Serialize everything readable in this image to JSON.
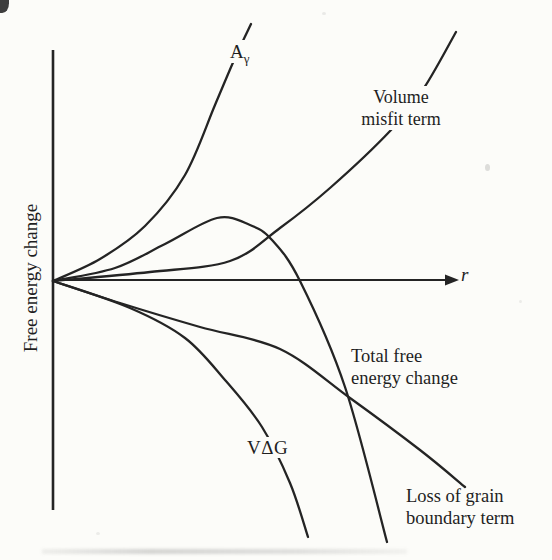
{
  "figure": {
    "background": "#fcfcf9",
    "ink": "#242424",
    "x_axis_label": "r",
    "y_axis_label": "Free energy change"
  },
  "labels": {
    "a_gamma": {
      "main": "A",
      "sub": "γ"
    },
    "volume_misfit": "Volume\nmisfit term",
    "total": "Total free\nenergy change",
    "v_delta_g": "VΔG",
    "grain_boundary": "Loss of grain\nboundary term",
    "x_axis": "r",
    "y_axis": "Free energy change"
  },
  "chart_data": {
    "type": "line",
    "title": "",
    "xlabel": "r",
    "ylabel": "Free energy change",
    "axes_style": "schematic (no numeric ticks); x-axis arrow to the right; origin on the y-axis",
    "units": "arbitrary (schematic nucleation free-energy diagram)",
    "xlim": [
      0,
      10.5
    ],
    "ylim": [
      -11.5,
      11.5
    ],
    "grid": false,
    "legend": "inline curve labels",
    "series": [
      {
        "id": "surface_area_term",
        "name": "Aγ",
        "shape": "positive, steeply increasing (interfacial area term)",
        "xy": [
          [
            0,
            0
          ],
          [
            1.2,
            0.9
          ],
          [
            2.3,
            2.3
          ],
          [
            3.3,
            4.6
          ],
          [
            4.05,
            7.6
          ],
          [
            4.55,
            9.7
          ],
          [
            4.95,
            11.1
          ]
        ],
        "px": [
          [
            53,
            281
          ],
          [
            100,
            259
          ],
          [
            145,
            226
          ],
          [
            185,
            175
          ],
          [
            215,
            105
          ],
          [
            235,
            58
          ],
          [
            251,
            24
          ]
        ]
      },
      {
        "id": "volume_misfit_term",
        "name": "Volume misfit term",
        "shape": "positive, slowly then steeply increasing",
        "xy": [
          [
            0,
            0
          ],
          [
            2.4,
            0.35
          ],
          [
            4.4,
            0.8
          ],
          [
            5.7,
            2.3
          ],
          [
            6.9,
            4.0
          ],
          [
            8.45,
            6.5
          ],
          [
            9.3,
            8.35
          ],
          [
            10.1,
            10.8
          ]
        ],
        "px": [
          [
            53,
            281
          ],
          [
            150,
            272
          ],
          [
            230,
            261
          ],
          [
            280,
            228
          ],
          [
            330,
            188
          ],
          [
            391,
            130
          ],
          [
            424,
            88
          ],
          [
            456,
            32
          ]
        ]
      },
      {
        "id": "total_free_energy_change",
        "name": "Total free energy change",
        "shape": "rises to a maximum near x=4.1 then decreases steeply",
        "xy": [
          [
            0,
            0
          ],
          [
            1.55,
            0.5
          ],
          [
            2.8,
            1.6
          ],
          [
            4.1,
            2.7
          ],
          [
            4.9,
            2.4
          ],
          [
            5.5,
            1.7
          ],
          [
            6.2,
            0
          ],
          [
            7.3,
            -4.65
          ],
          [
            8.35,
            -11.4
          ]
        ],
        "px": [
          [
            53,
            281
          ],
          [
            115,
            268
          ],
          [
            165,
            244
          ],
          [
            217,
            218
          ],
          [
            250,
            225
          ],
          [
            272,
            240
          ],
          [
            300,
            281
          ],
          [
            345,
            387
          ],
          [
            387,
            542
          ]
        ]
      },
      {
        "id": "v_delta_g",
        "name": "VΔG",
        "shape": "negative, steeply decreasing (volume free energy term)",
        "xy": [
          [
            0,
            0
          ],
          [
            1.9,
            -1.2
          ],
          [
            3.3,
            -2.5
          ],
          [
            4.3,
            -4.3
          ],
          [
            5.2,
            -6.4
          ],
          [
            5.9,
            -8.8
          ],
          [
            6.4,
            -11.2
          ]
        ],
        "px": [
          [
            53,
            281
          ],
          [
            130,
            308
          ],
          [
            185,
            338
          ],
          [
            225,
            380
          ],
          [
            262,
            427
          ],
          [
            290,
            483
          ],
          [
            308,
            537
          ]
        ]
      },
      {
        "id": "grain_boundary_loss",
        "name": "Loss of grain boundary term",
        "shape": "negative, gently decreasing",
        "xy": [
          [
            0,
            0
          ],
          [
            1.7,
            -1.0
          ],
          [
            3.7,
            -2.0
          ],
          [
            5.7,
            -3.0
          ],
          [
            7.4,
            -5.1
          ],
          [
            9.2,
            -7.4
          ],
          [
            10.3,
            -9.0
          ]
        ],
        "px": [
          [
            53,
            281
          ],
          [
            120,
            303
          ],
          [
            200,
            327
          ],
          [
            280,
            349
          ],
          [
            350,
            398
          ],
          [
            420,
            450
          ],
          [
            465,
            487
          ]
        ]
      }
    ]
  }
}
